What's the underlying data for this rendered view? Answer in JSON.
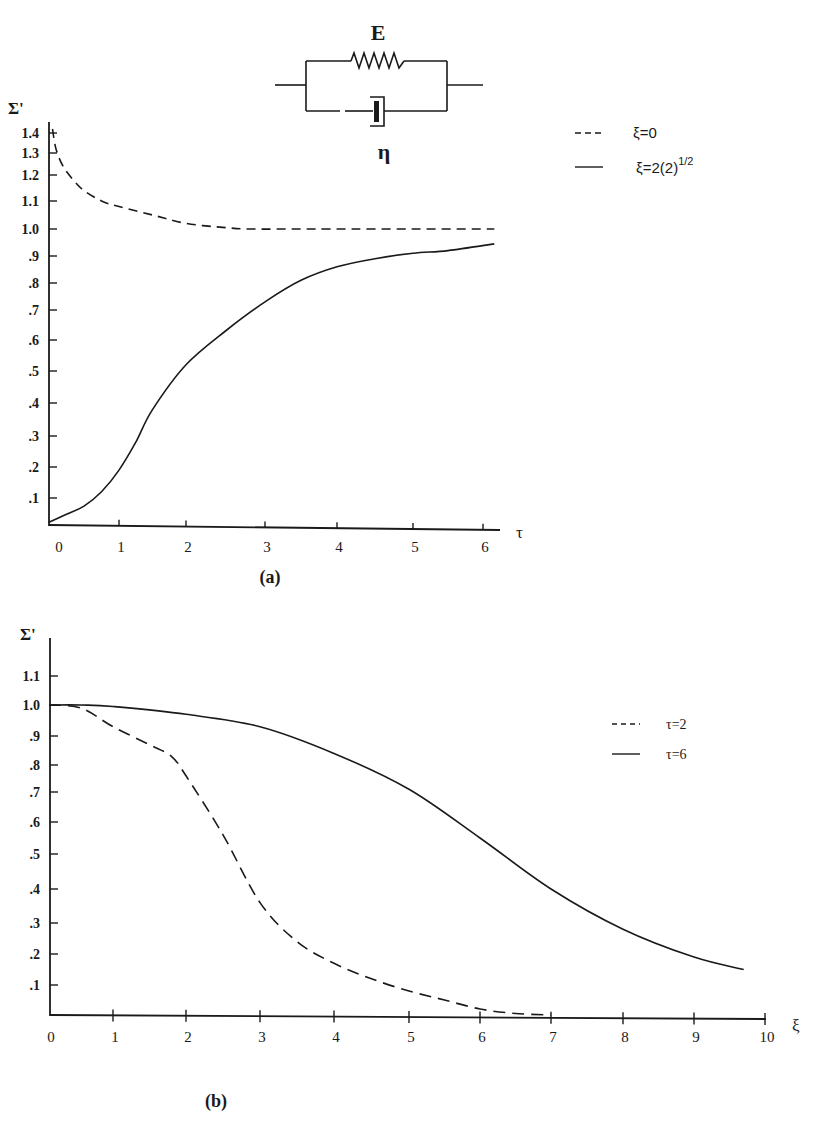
{
  "colors": {
    "ink": "#1a1a1a",
    "background": "#ffffff"
  },
  "circuit": {
    "spring_label": "E",
    "dashpot_label": "η",
    "description": "Kelvin-Voigt element: spring E in parallel with dashpot η"
  },
  "panel_a": {
    "label": "(a)",
    "y_axis_title": "Σ'",
    "x_axis_title": "τ",
    "y_ticks": [
      ".1",
      ".2",
      ".3",
      ".4",
      ".5",
      ".6",
      ".7",
      ".8",
      ".9",
      "1.0",
      "1.1",
      "1.2",
      "1.3",
      "1.4"
    ],
    "x_ticks": [
      "0",
      "1",
      "2",
      "3",
      "4",
      "5",
      "6"
    ],
    "legend": [
      {
        "style": "dashed",
        "label": "ξ=0"
      },
      {
        "style": "solid",
        "label": "ξ=2(2)",
        "superscript": "1/2"
      }
    ]
  },
  "panel_b": {
    "label": "(b)",
    "y_axis_title": "Σ'",
    "x_axis_title": "ξ",
    "y_ticks": [
      ".1",
      ".2",
      ".3",
      ".4",
      ".5",
      ".6",
      ".7",
      ".8",
      ".9",
      "1.0",
      "1.1"
    ],
    "x_ticks": [
      "0",
      "1",
      "2",
      "3",
      "4",
      "5",
      "6",
      "7",
      "8",
      "9",
      "10"
    ],
    "legend": [
      {
        "style": "dashed",
        "label": "τ=2"
      },
      {
        "style": "solid",
        "label": "τ=6"
      }
    ]
  },
  "chart_data": [
    {
      "type": "line",
      "title": "(a)",
      "xlabel": "τ",
      "ylabel": "Σ'",
      "xlim": [
        0,
        6.2
      ],
      "ylim": [
        0,
        1.45
      ],
      "grid": false,
      "legend_position": "upper right",
      "series": [
        {
          "name": "ξ=0",
          "style": "dashed",
          "x": [
            0.05,
            0.1,
            0.2,
            0.35,
            0.5,
            0.75,
            1.0,
            1.5,
            2.0,
            2.5,
            2.8,
            3.5,
            4.0,
            5.0,
            6.2
          ],
          "y": [
            1.42,
            1.32,
            1.24,
            1.18,
            1.14,
            1.1,
            1.08,
            1.05,
            1.02,
            1.005,
            1.0,
            1.0,
            1.0,
            1.0,
            1.0
          ]
        },
        {
          "name": "ξ=2(2)^1/2",
          "style": "solid",
          "x": [
            0.0,
            0.25,
            0.5,
            0.75,
            1.0,
            1.25,
            1.5,
            2.0,
            2.5,
            3.0,
            3.5,
            4.0,
            4.5,
            5.0,
            5.5,
            6.2
          ],
          "y": [
            0.01,
            0.04,
            0.07,
            0.12,
            0.19,
            0.28,
            0.38,
            0.52,
            0.63,
            0.73,
            0.81,
            0.86,
            0.89,
            0.91,
            0.92,
            0.945
          ]
        }
      ]
    },
    {
      "type": "line",
      "title": "(b)",
      "xlabel": "ξ",
      "ylabel": "Σ'",
      "xlim": [
        0,
        10
      ],
      "ylim": [
        0,
        1.15
      ],
      "grid": false,
      "legend_position": "upper right",
      "series": [
        {
          "name": "τ=2",
          "style": "dashed",
          "x": [
            0.0,
            0.5,
            1.0,
            1.5,
            1.8,
            2.0,
            2.5,
            3.0,
            3.5,
            4.0,
            4.5,
            5.0,
            5.5,
            6.0,
            6.5,
            7.0
          ],
          "y": [
            1.0,
            0.99,
            0.93,
            0.87,
            0.83,
            0.76,
            0.56,
            0.36,
            0.24,
            0.17,
            0.12,
            0.08,
            0.05,
            0.02,
            0.005,
            0.0
          ]
        },
        {
          "name": "τ=6",
          "style": "solid",
          "x": [
            0.0,
            0.5,
            1.0,
            2.0,
            3.0,
            4.0,
            5.0,
            6.0,
            7.0,
            8.0,
            9.0,
            9.7
          ],
          "y": [
            1.0,
            1.0,
            0.995,
            0.97,
            0.93,
            0.84,
            0.71,
            0.55,
            0.4,
            0.28,
            0.19,
            0.15
          ]
        }
      ]
    }
  ]
}
